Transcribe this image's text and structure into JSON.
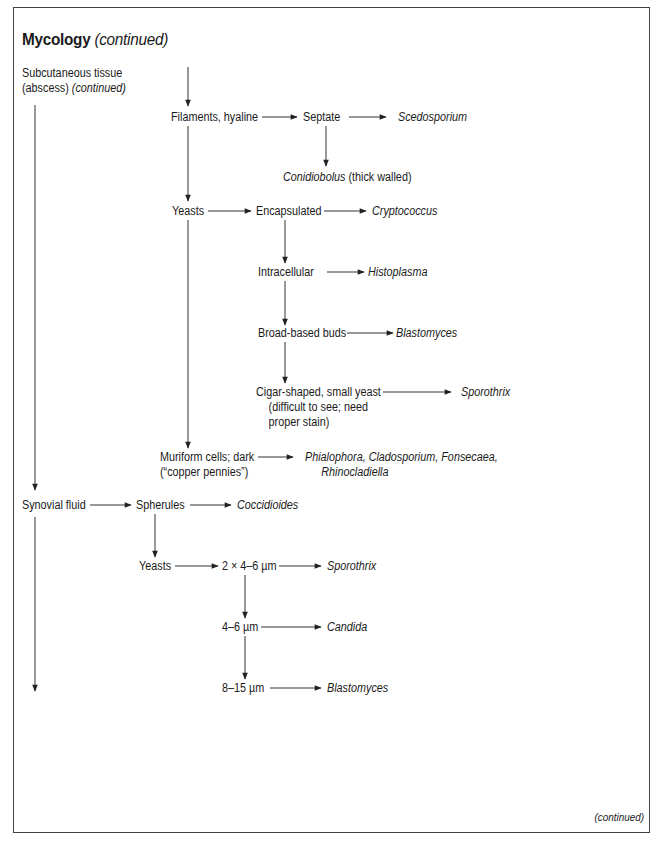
{
  "page": {
    "title_main": "Mycology",
    "title_suffix": "(continued)",
    "footer": "(continued)"
  },
  "nodes": {
    "subcut_line1": "Subcutaneous tissue",
    "subcut_line2_a": "(abscess)",
    "subcut_line2_b": "(continued)",
    "filaments": "Filaments, hyaline",
    "septate": "Septate",
    "scedosporium": "Scedosporium",
    "conidiobolus": "Conidiobolus",
    "conidiobolus_note": "(thick walled)",
    "yeasts1": "Yeasts",
    "encapsulated": "Encapsulated",
    "cryptococcus": "Cryptococcus",
    "intracellular": "Intracellular",
    "histoplasma": "Histoplasma",
    "broad_based": "Broad-based buds",
    "blastomyces1": "Blastomyces",
    "cigar_line1": "Cigar-shaped, small yeast",
    "cigar_line2": "(difficult to see; need",
    "cigar_line3": "proper stain)",
    "sporothrix1": "Sporothrix",
    "muriform_line1": "Muriform cells; dark",
    "muriform_line2": "(“copper pennies”)",
    "muriform_result_line1": "Phialophora, Cladosporium, Fonsecaea,",
    "muriform_result_line2": "Rhinocladiella",
    "synovial": "Synovial fluid",
    "spherules": "Spherules",
    "coccidioides": "Coccidioides",
    "yeasts2": "Yeasts",
    "size_2x4_6": "2 × 4–6 µm",
    "sporothrix2": "Sporothrix",
    "size_4_6": "4–6 µm",
    "candida": "Candida",
    "size_8_15": "8–15 µm",
    "blastomyces2": "Blastomyces"
  },
  "colors": {
    "line": "#333333",
    "frame": "#444444",
    "text": "#1a1a1a"
  }
}
